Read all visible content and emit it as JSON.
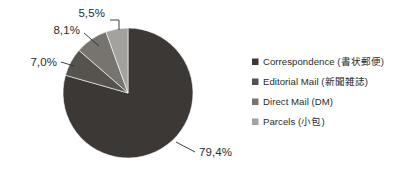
{
  "chart_data": {
    "type": "pie",
    "title": "",
    "categories": [
      "Correspondence (書状郵便)",
      "Editorial Mail (新聞雑誌)",
      "Direct Mail (DM)",
      "Parcels (小包)"
    ],
    "values": [
      79.4,
      7.0,
      8.1,
      5.5
    ],
    "value_labels": [
      "79,4%",
      "7,0%",
      "8,1%",
      "5,5%"
    ],
    "colors": [
      "#3b3836",
      "#56534f",
      "#77746f",
      "#a3a29e"
    ],
    "legend_position": "right",
    "grid": false,
    "xlabel": "",
    "ylabel": ""
  },
  "legend": {
    "items": [
      {
        "label": "Correspondence (書状郵便)",
        "color": "#3b3836"
      },
      {
        "label": "Editorial Mail (新聞雑誌)",
        "color": "#56534f"
      },
      {
        "label": "Direct Mail (DM)",
        "color": "#77746f"
      },
      {
        "label": "Parcels (小包)",
        "color": "#a3a29e"
      }
    ]
  },
  "callouts": {
    "parcels": "5,5%",
    "direct_mail": "8,1%",
    "editorial_mail": "7,0%",
    "correspondence": "79,4%"
  },
  "style": {
    "background": "#ffffff",
    "text_color": "#2b2b2b"
  }
}
